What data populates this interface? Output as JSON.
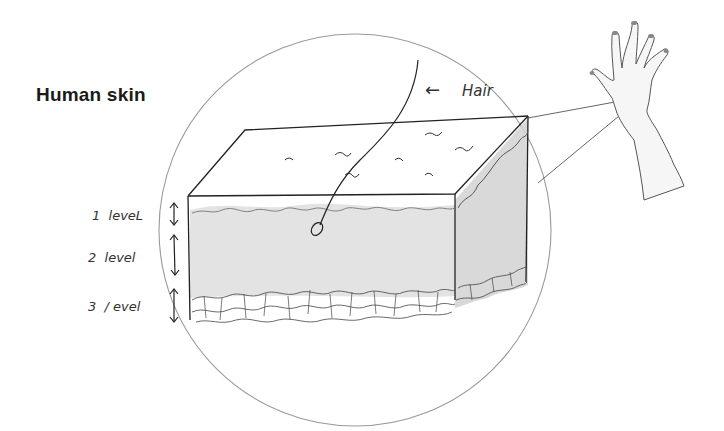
{
  "diagram": {
    "title": "Human skin",
    "labels": {
      "hair": "Hair",
      "hair_arrow": "←"
    },
    "levels": [
      {
        "id": 1,
        "label": "1  leveL"
      },
      {
        "id": 2,
        "label": "2  level"
      },
      {
        "id": 3,
        "label": "3  / evel"
      }
    ],
    "colors": {
      "ink": "#222222",
      "pencil": "#555555",
      "circle": "#9a9a9a",
      "shade": "#dcdcdc",
      "shade_side": "#cfcfcf",
      "background": "#ffffff"
    },
    "style": "hand-drawn pencil sketch"
  }
}
